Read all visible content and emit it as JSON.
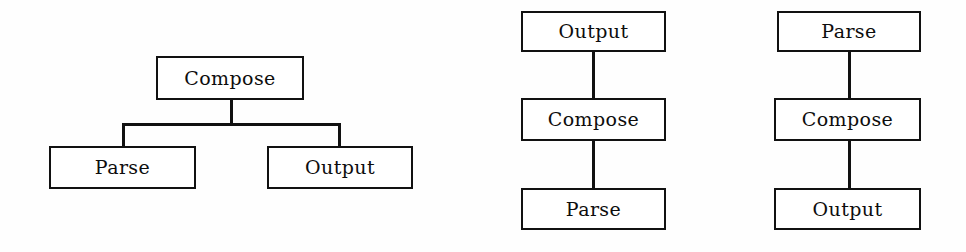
{
  "figure": {
    "background_color": "#fefefe",
    "line_color": "#111111",
    "text_color": "#0d0d0d",
    "diagram_count": 3
  },
  "diagrams": [
    {
      "id": "tree-hierarchy",
      "layout": "tree",
      "nodes": [
        {
          "id": "compose",
          "label": "Compose",
          "level": 0
        },
        {
          "id": "parse",
          "label": "Parse",
          "level": 1
        },
        {
          "id": "output",
          "label": "Output",
          "level": 1
        }
      ],
      "edges": [
        {
          "from": "compose",
          "to": "parse"
        },
        {
          "from": "compose",
          "to": "output"
        }
      ]
    },
    {
      "id": "chain-output-compose-parse",
      "layout": "vertical-chain",
      "nodes": [
        {
          "id": "output",
          "label": "Output",
          "level": 0
        },
        {
          "id": "compose",
          "label": "Compose",
          "level": 1
        },
        {
          "id": "parse",
          "label": "Parse",
          "level": 2
        }
      ],
      "edges": [
        {
          "from": "output",
          "to": "compose"
        },
        {
          "from": "compose",
          "to": "parse"
        }
      ]
    },
    {
      "id": "chain-parse-compose-output",
      "layout": "vertical-chain",
      "nodes": [
        {
          "id": "parse",
          "label": "Parse",
          "level": 0
        },
        {
          "id": "compose",
          "label": "Compose",
          "level": 1
        },
        {
          "id": "output",
          "label": "Output",
          "level": 2
        }
      ],
      "edges": [
        {
          "from": "parse",
          "to": "compose"
        },
        {
          "from": "compose",
          "to": "output"
        }
      ]
    }
  ]
}
